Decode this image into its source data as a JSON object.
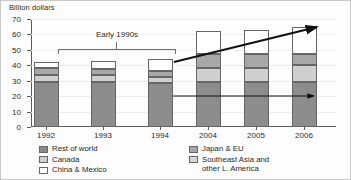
{
  "chart_data": {
    "type": "bar",
    "subtype": "stacked-bar",
    "title": "",
    "ylabel": "Billion dollars",
    "xlabel": "",
    "ylim": [
      0,
      70
    ],
    "yticks": [
      0,
      10,
      20,
      30,
      40,
      50,
      60,
      70
    ],
    "grid": true,
    "legend_position": "bottom",
    "categories": [
      "1992",
      "1993",
      "1994",
      "2004",
      "2005",
      "2006"
    ],
    "series": [
      {
        "name": "Rest of world",
        "color": "#8c8c8c",
        "values": [
          29.5,
          29.0,
          28.5,
          29.5,
          29.0,
          29.5
        ]
      },
      {
        "name": "Canada",
        "color": "#cfcfcf",
        "values": [
          4.0,
          4.5,
          4.0,
          9.0,
          9.5,
          10.5
        ]
      },
      {
        "name": "Japan & EU",
        "color": "#a8a8a8",
        "values": [
          4.5,
          4.0,
          4.0,
          9.0,
          9.0,
          7.5
        ]
      },
      {
        "name": "Southeast Asia and other L. America",
        "color": "#d8d8d8",
        "values": [
          0.0,
          0.0,
          0.0,
          0.0,
          0.0,
          0.0
        ]
      },
      {
        "name": "China & Mexico",
        "color": "#ffffff",
        "values": [
          4.0,
          5.5,
          7.5,
          14.5,
          15.5,
          17.5
        ]
      }
    ],
    "totals": [
      42.0,
      43.0,
      44.0,
      62.0,
      63.0,
      65.0
    ],
    "annotations": [
      {
        "name": "early-1990s-bracket",
        "text": "Early 1990s",
        "spans": [
          "1992",
          "1994"
        ]
      },
      {
        "name": "rising-trend-arrow",
        "text": "",
        "from": [
          1994,
          42
        ],
        "to": [
          2006,
          65
        ]
      },
      {
        "name": "flat-trend-arrow",
        "text": "",
        "from": [
          1994,
          20
        ],
        "to": [
          2006,
          20
        ]
      }
    ]
  },
  "axis": {
    "y_title": "Billion dollars",
    "y_labels": [
      "70",
      "60",
      "50",
      "40",
      "30",
      "20",
      "10",
      "0"
    ],
    "x_labels": [
      "1992",
      "1993",
      "1994",
      "2004",
      "2005",
      "2006"
    ]
  },
  "bracket": {
    "label": "Early 1990s"
  },
  "legend": {
    "left": [
      {
        "swatch": "rest-of-world-swatch",
        "class": "s-rest",
        "label": "Rest of world"
      },
      {
        "swatch": "canada-swatch",
        "class": "s-can",
        "label": "Canada"
      },
      {
        "swatch": "china-mexico-swatch",
        "class": "s-cm",
        "label": "China & Mexico"
      }
    ],
    "right": [
      {
        "swatch": "japan-eu-swatch",
        "class": "s-japan",
        "label": "Japan & EU"
      },
      {
        "swatch": "southeast-asia-swatch",
        "class": "s-sea",
        "label": "Southeast Asia and\nother L. America"
      }
    ]
  },
  "colors": {
    "rest_of_world": "#8c8c8c",
    "canada": "#cfcfcf",
    "japan_eu": "#a8a8a8",
    "southeast_asia": "#d8d8d8",
    "china_mexico": "#ffffff",
    "axis": "#5a5a5a",
    "gridline": "#ededed",
    "annotation": "#1a1a1a"
  }
}
